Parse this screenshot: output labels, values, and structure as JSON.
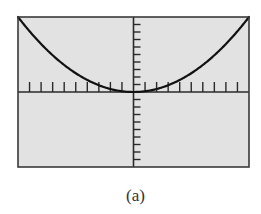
{
  "caption": "(a)",
  "colors": {
    "screen_bg": "#e2e2e2",
    "frame": "#3a3a3a",
    "axis": "#2a2a2a",
    "curve": "#111111"
  },
  "chart_data": {
    "type": "line",
    "title": "",
    "xlabel": "",
    "ylabel": "",
    "xlim": [
      -10,
      10
    ],
    "ylim": [
      -10,
      10
    ],
    "xscl": 1,
    "yscl": 1,
    "grid": false,
    "legend": "none",
    "series": [
      {
        "name": "y = 0.1x^2",
        "x": [
          -10,
          -8,
          -6,
          -4,
          -2,
          0,
          2,
          4,
          6,
          8,
          10
        ],
        "y": [
          10,
          6.4,
          3.6,
          1.6,
          0.4,
          0,
          0.4,
          1.6,
          3.6,
          6.4,
          10
        ]
      }
    ],
    "annotations": [
      "(a)"
    ]
  }
}
